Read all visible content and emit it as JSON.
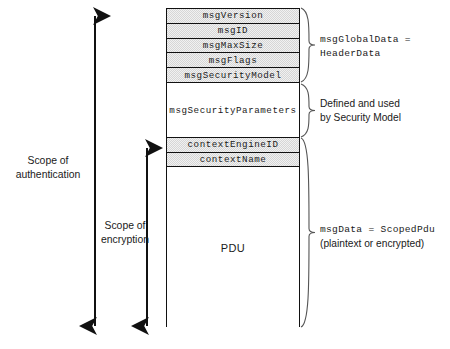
{
  "diagram": {
    "box": {
      "fields": [
        {
          "name": "msgVersion",
          "style": "shaded",
          "top": 0,
          "height": 14.8
        },
        {
          "name": "msgID",
          "style": "shaded",
          "top": 14.8,
          "height": 14.8
        },
        {
          "name": "msgMaxSize",
          "style": "shaded",
          "top": 29.6,
          "height": 14.8
        },
        {
          "name": "msgFlags",
          "style": "shaded",
          "top": 44.4,
          "height": 14.8
        },
        {
          "name": "msgSecurityModel",
          "style": "shaded",
          "top": 59.2,
          "height": 14.8
        },
        {
          "name": "msgSecurityParameters",
          "style": "plain",
          "top": 74,
          "height": 55
        },
        {
          "name": "contextEngineID",
          "style": "shaded",
          "top": 129,
          "height": 14.5
        },
        {
          "name": "contextName",
          "style": "shaded",
          "top": 143.5,
          "height": 14.5
        }
      ],
      "pdu_label": "PDU"
    },
    "right_groups": [
      {
        "id": "global-data",
        "lines": [
          "msgGlobalData =",
          "HeaderData"
        ],
        "mono_lines": [
          true,
          true
        ],
        "brace_top": 8,
        "brace_bottom": 82,
        "label_top": 33
      },
      {
        "id": "security-parameters",
        "lines": [
          "Defined and used",
          "by Security Model"
        ],
        "mono_lines": [
          false,
          false
        ],
        "brace_top": 84,
        "brace_bottom": 137,
        "label_top": 97
      },
      {
        "id": "msg-data",
        "lines": [
          "msgData = ScopedPdu",
          "(plaintext or encrypted)"
        ],
        "mono_lines": [
          true,
          false
        ],
        "brace_top": 138,
        "brace_bottom": 327,
        "label_top": 223
      }
    ],
    "left_scopes": [
      {
        "id": "authentication",
        "lines": [
          "Scope of",
          "authentication"
        ],
        "arrow_x": 95,
        "arrow_top": 8,
        "arrow_bottom": 334,
        "label_center_x": 48,
        "label_top": 154
      },
      {
        "id": "encryption",
        "lines": [
          "Scope of",
          "encryption"
        ],
        "arrow_x": 147,
        "arrow_top": 140,
        "arrow_bottom": 334,
        "label_center_x": 125,
        "label_top": 219
      }
    ],
    "colors": {
      "stroke": "#111111",
      "shade": "#d6d6d6",
      "text": "#1a1a1a",
      "background": "#ffffff"
    }
  }
}
